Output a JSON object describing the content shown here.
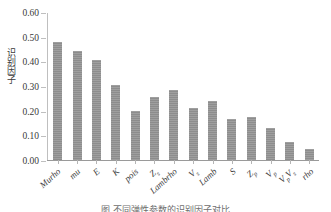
{
  "chart_data": {
    "type": "bar",
    "title": "",
    "xlabel": "",
    "ylabel": "识别因子",
    "ylim": [
      0.0,
      0.6
    ],
    "ytick_labels": [
      "0.60",
      "0.50",
      "0.40",
      "0.30",
      "0.20",
      "0.10",
      "0.00"
    ],
    "ytick_values": [
      0.6,
      0.5,
      0.4,
      0.3,
      0.2,
      0.1,
      0.0
    ],
    "grid": false,
    "legend": false,
    "bar_color": "#8d8d8d",
    "axis_color": "#b5b5b5",
    "categories": [
      "Murho",
      "mu",
      "E",
      "K",
      "pois",
      "Zs",
      "Lambrho",
      "Vs",
      "Lamb",
      "S",
      "Zp",
      "Vp",
      "VpVs",
      "rho"
    ],
    "category_labels": [
      {
        "base": "Murho",
        "sub": ""
      },
      {
        "base": "mu",
        "sub": ""
      },
      {
        "base": "E",
        "sub": ""
      },
      {
        "base": "K",
        "sub": ""
      },
      {
        "base": "pois",
        "sub": ""
      },
      {
        "base": "Z",
        "sub": "s"
      },
      {
        "base": "Lambrho",
        "sub": ""
      },
      {
        "base": "V",
        "sub": "s"
      },
      {
        "base": "Lamb",
        "sub": ""
      },
      {
        "base": "S",
        "sub": ""
      },
      {
        "base": "Z",
        "sub": "p"
      },
      {
        "base": "V",
        "sub": "p"
      },
      {
        "base": "V",
        "sub": "p"
      },
      {
        "base": "rho",
        "sub": ""
      }
    ],
    "values": [
      0.478,
      0.44,
      0.405,
      0.306,
      0.197,
      0.256,
      0.283,
      0.209,
      0.238,
      0.166,
      0.175,
      0.128,
      0.074,
      0.043
    ]
  },
  "caption": {
    "text": "图     不同弹性参数的识别因子对比"
  }
}
